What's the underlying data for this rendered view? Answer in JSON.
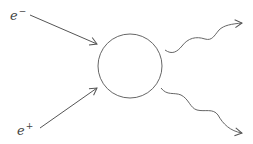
{
  "diagram": {
    "particles": {
      "electron": {
        "symbol": "e",
        "charge": "−"
      },
      "positron": {
        "symbol": "e",
        "charge": "+"
      }
    },
    "vertex": {
      "shape": "circle"
    },
    "outgoing": [
      {
        "name": "photon-1",
        "style": "wavy"
      },
      {
        "name": "photon-2",
        "style": "wavy"
      }
    ],
    "stroke_color": "#555555"
  }
}
